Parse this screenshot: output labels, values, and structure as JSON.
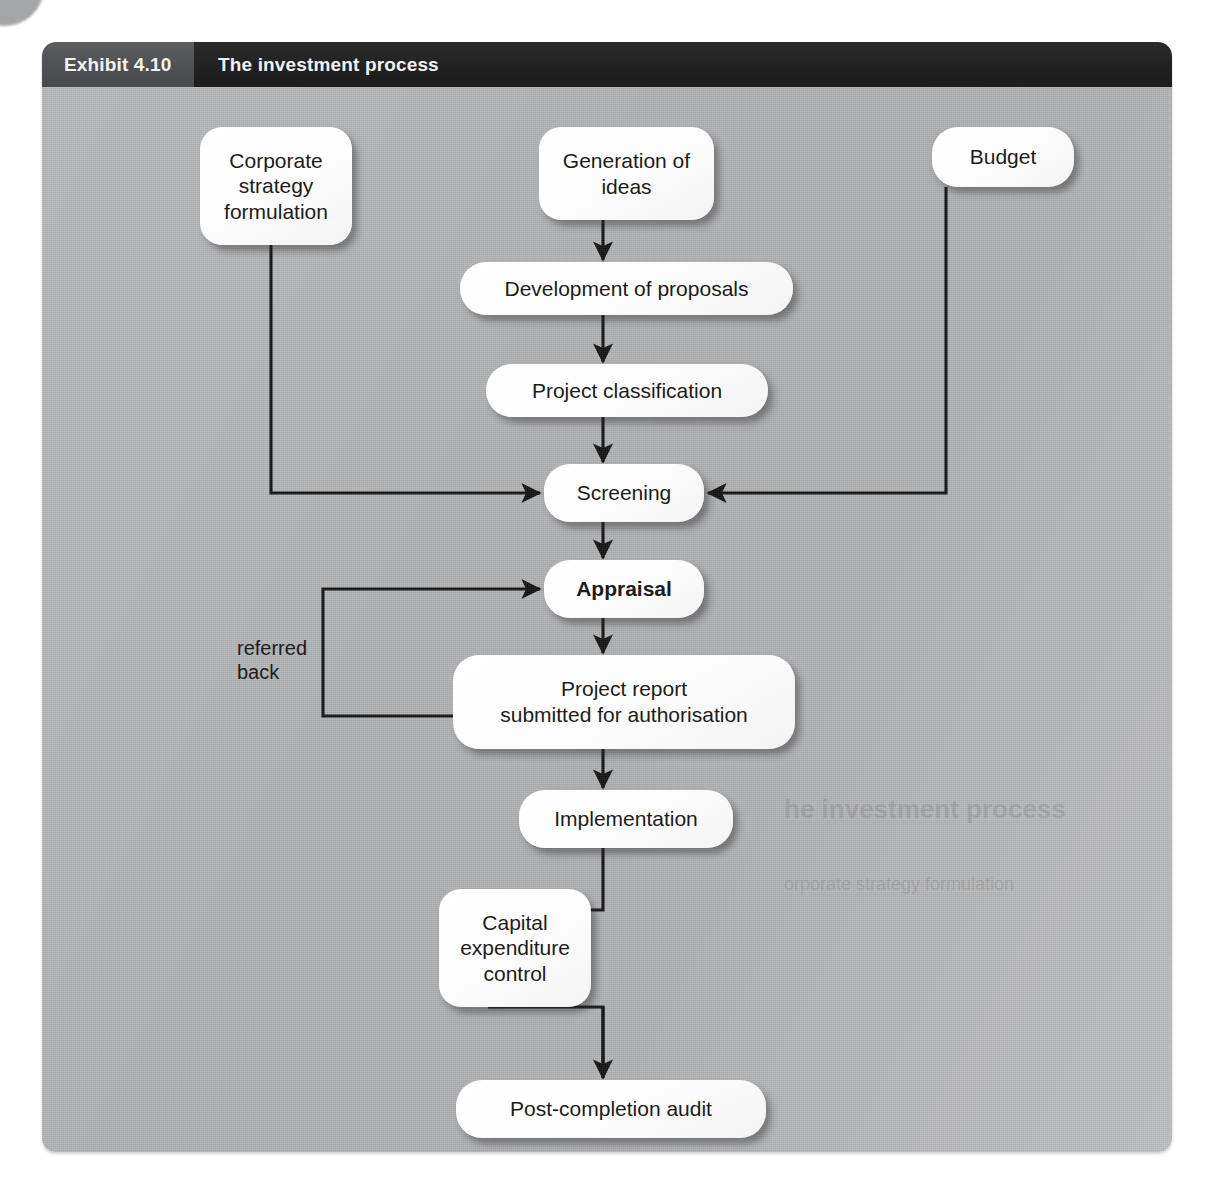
{
  "exhibit": {
    "number_label": "Exhibit 4.10",
    "title": "The investment process"
  },
  "diagram": {
    "type": "flowchart",
    "nodes": [
      {
        "id": "corporate-strategy",
        "label": "Corporate\nstrategy\nformulation",
        "x": 158,
        "y": 85,
        "w": 152,
        "h": 118
      },
      {
        "id": "generation-of-ideas",
        "label": "Generation of\nideas",
        "x": 497,
        "y": 85,
        "w": 175,
        "h": 93
      },
      {
        "id": "budget",
        "label": "Budget",
        "x": 890,
        "y": 85,
        "w": 142,
        "h": 60
      },
      {
        "id": "development",
        "label": "Development of proposals",
        "x": 418,
        "y": 220,
        "w": 333,
        "h": 53
      },
      {
        "id": "classification",
        "label": "Project classification",
        "x": 444,
        "y": 322,
        "w": 282,
        "h": 53
      },
      {
        "id": "screening",
        "label": "Screening",
        "x": 502,
        "y": 422,
        "w": 160,
        "h": 58
      },
      {
        "id": "appraisal",
        "label": "Appraisal",
        "x": 502,
        "y": 518,
        "w": 160,
        "h": 58,
        "bold": true
      },
      {
        "id": "project-report",
        "label": "Project report\nsubmitted for authorisation",
        "x": 411,
        "y": 613,
        "w": 342,
        "h": 94
      },
      {
        "id": "implementation",
        "label": "Implementation",
        "x": 477,
        "y": 748,
        "w": 214,
        "h": 58
      },
      {
        "id": "capex-control",
        "label": "Capital\nexpenditure\ncontrol",
        "x": 397,
        "y": 847,
        "w": 152,
        "h": 118
      },
      {
        "id": "post-completion",
        "label": "Post-completion audit",
        "x": 414,
        "y": 1038,
        "w": 310,
        "h": 58
      }
    ],
    "edge_labels": [
      {
        "id": "referred-back",
        "label": "referred\nback",
        "x": 195,
        "y": 594
      }
    ],
    "edges": [
      {
        "from": "generation-of-ideas",
        "to": "development",
        "kind": "arrow-down"
      },
      {
        "from": "development",
        "to": "classification",
        "kind": "arrow-down"
      },
      {
        "from": "classification",
        "to": "screening",
        "kind": "arrow-down"
      },
      {
        "from": "corporate-strategy",
        "to": "screening",
        "kind": "elbow-right-arrow"
      },
      {
        "from": "budget",
        "to": "screening",
        "kind": "elbow-left-arrow"
      },
      {
        "from": "screening",
        "to": "appraisal",
        "kind": "arrow-down"
      },
      {
        "from": "appraisal",
        "to": "project-report",
        "kind": "arrow-down"
      },
      {
        "from": "project-report",
        "to": "appraisal",
        "kind": "feedback-loop",
        "label": "referred back"
      },
      {
        "from": "project-report",
        "to": "implementation",
        "kind": "arrow-down"
      },
      {
        "from": "implementation",
        "to": "capex-control",
        "kind": "bypass-loop"
      },
      {
        "from": "implementation",
        "to": "post-completion",
        "kind": "arrow-down"
      }
    ]
  },
  "colors": {
    "panel_background": "#b4b5b7",
    "header_left": "#515356",
    "header_right": "#232324",
    "node_fill": "#fbfbfb",
    "line": "#141414",
    "text": "#1c1c1c",
    "header_text": "#f2f2f2"
  },
  "ghost_text": {
    "line1": "he investment process",
    "line2": "orporate strategy formulation"
  }
}
